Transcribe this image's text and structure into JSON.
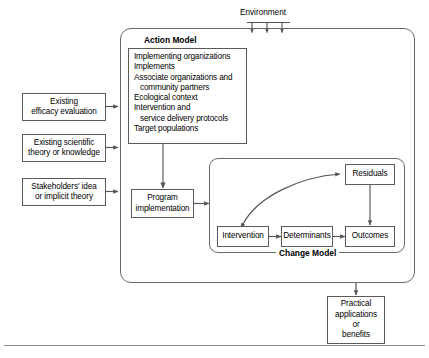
{
  "figure": {
    "environment_label": "Environment",
    "environment_arrow_count": 3
  },
  "inputs": [
    {
      "id": "efficacy",
      "line1": "Existing",
      "line2": "efficacy evaluation"
    },
    {
      "id": "theory",
      "line1": "Existing scientific",
      "line2": "theory or knowledge"
    },
    {
      "id": "stakeholders",
      "line1": "Stakeholders' idea",
      "line2": "or implicit theory"
    }
  ],
  "action_model": {
    "heading": "Action Model",
    "items": [
      {
        "text": "Implementing organizations",
        "indent": false
      },
      {
        "text": "Implements",
        "indent": false
      },
      {
        "text": "Associate organizations and",
        "indent": false
      },
      {
        "text": "community partners",
        "indent": true
      },
      {
        "text": "Ecological context",
        "indent": false
      },
      {
        "text": "Intervention and",
        "indent": false
      },
      {
        "text": "service delivery protocols",
        "indent": true
      },
      {
        "text": "Target populations",
        "indent": false
      }
    ]
  },
  "program_implementation": {
    "line1": "Program",
    "line2": "implementation"
  },
  "change_model": {
    "heading": "Change Model",
    "nodes": {
      "intervention": "Intervention",
      "determinants": "Determinants",
      "outcomes": "Outcomes",
      "residuals": "Residuals"
    }
  },
  "practical": {
    "line1": "Practical",
    "line2": "applications",
    "line3": "or",
    "line4": "benefits"
  },
  "colors": {
    "stroke": "#5a5a5a",
    "container_stroke": "#6a6a6a",
    "arrow": "#555555",
    "text": "#000000",
    "background": "#ffffff",
    "rule": "#8c8c8c"
  }
}
